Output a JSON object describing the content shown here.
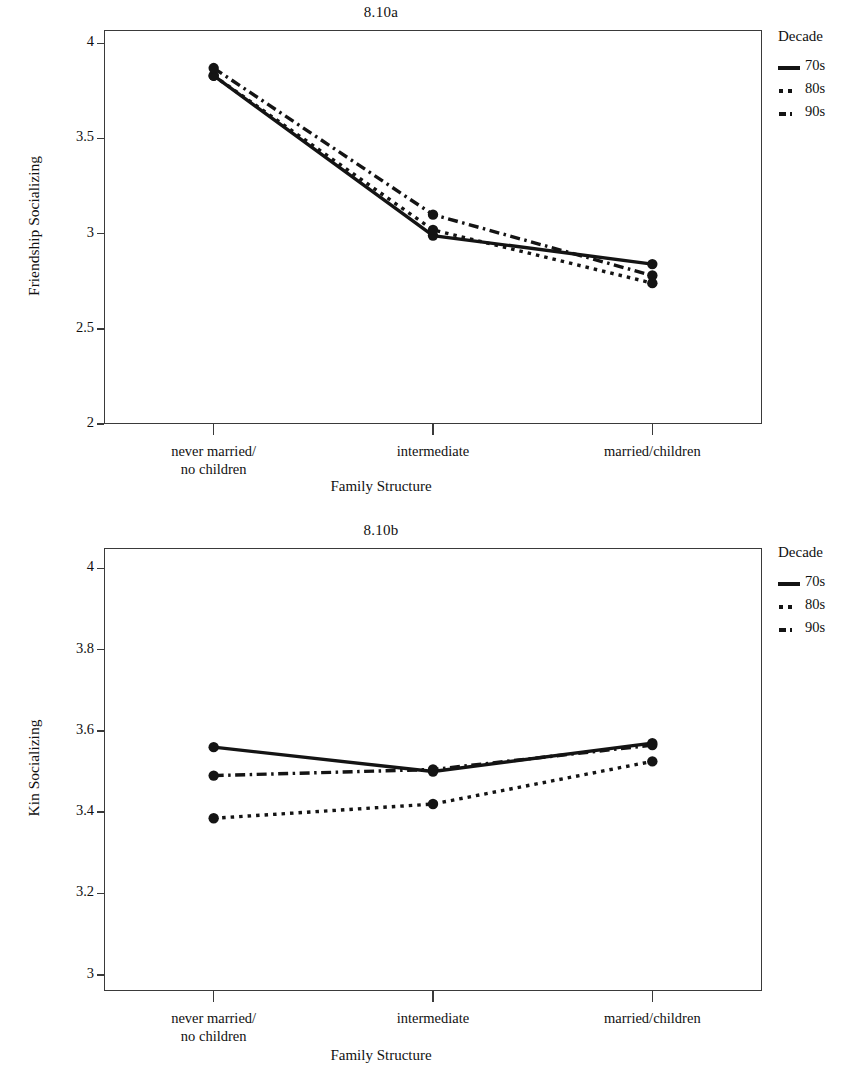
{
  "figure": {
    "legend_title": "Decade",
    "xlabel": "Family Structure",
    "categories": [
      "never married/\nno children",
      "intermediate",
      "married/children"
    ],
    "series_names": [
      "70s",
      "80s",
      "90s"
    ],
    "colors": {
      "ink": "#141414",
      "frame": "#3a3a3a",
      "background": "#ffffff"
    }
  },
  "chart_data": [
    {
      "type": "line",
      "title": "8.10a",
      "xlabel": "Family Structure",
      "ylabel": "Friendship Socializing",
      "categories": [
        "never married/no children",
        "intermediate",
        "married/children"
      ],
      "ylim": [
        2,
        4.07
      ],
      "yticks": [
        2,
        2.5,
        3,
        3.5,
        4
      ],
      "ytick_labels": [
        "2",
        "2.5",
        "3",
        "3.5",
        "4"
      ],
      "grid": false,
      "legend_position": "right",
      "legend_title": "Decade",
      "series": [
        {
          "name": "70s",
          "style": "solid",
          "values": [
            3.83,
            2.99,
            2.84
          ]
        },
        {
          "name": "80s",
          "style": "dotted",
          "values": [
            3.83,
            3.02,
            2.74
          ]
        },
        {
          "name": "90s",
          "style": "dashdot",
          "values": [
            3.87,
            3.1,
            2.78
          ]
        }
      ]
    },
    {
      "type": "line",
      "title": "8.10b",
      "xlabel": "Family Structure",
      "ylabel": "Kin Socializing",
      "categories": [
        "never married/no children",
        "intermediate",
        "married/children"
      ],
      "ylim": [
        2.96,
        4.05
      ],
      "yticks": [
        3,
        3.2,
        3.4,
        3.6,
        3.8,
        4
      ],
      "ytick_labels": [
        "3",
        "3.2",
        "3.4",
        "3.6",
        "3.8",
        "4"
      ],
      "grid": false,
      "legend_position": "right",
      "legend_title": "Decade",
      "series": [
        {
          "name": "70s",
          "style": "solid",
          "values": [
            3.56,
            3.5,
            3.57
          ]
        },
        {
          "name": "80s",
          "style": "dotted",
          "values": [
            3.385,
            3.42,
            3.525
          ]
        },
        {
          "name": "90s",
          "style": "dashdot",
          "values": [
            3.49,
            3.505,
            3.565
          ]
        }
      ]
    }
  ]
}
